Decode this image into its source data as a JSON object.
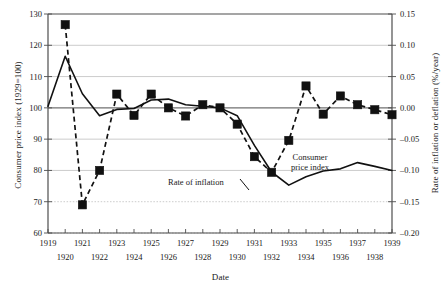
{
  "figure": {
    "background": "#ffffff",
    "plot_border_color": "#4d4d4d",
    "gridline_color": "#b5b5b5",
    "series_color": "#111111"
  },
  "axes": {
    "x": {
      "label": "Date",
      "ticks_top_row": [
        "1919",
        "1921",
        "1923",
        "1925",
        "1927",
        "1929",
        "1931",
        "1933",
        "1935",
        "1937",
        "1939"
      ],
      "ticks_bottom_row": [
        "1920",
        "1922",
        "1924",
        "1926",
        "1928",
        "1930",
        "1932",
        "1934",
        "1936",
        "1938"
      ],
      "min": 1919,
      "max": 1939
    },
    "y_left": {
      "label": "Consumer price index (1929=100)",
      "ticks": [
        "130",
        "120",
        "110",
        "100",
        "90",
        "80",
        "70",
        "60"
      ],
      "min": 60,
      "max": 130
    },
    "y_right": {
      "label": "Rate of inflation or deflation (%/year)",
      "ticks": [
        "0.15",
        "0.10",
        "0.05",
        "0.00",
        "–0.05",
        "–0.10",
        "–0.15",
        "–0.20"
      ],
      "min": -0.2,
      "max": 0.15
    }
  },
  "annotations": {
    "inflation": "Rate of inflation",
    "cpi_line1": "Consumer",
    "cpi_line2": "price index"
  },
  "chart_data": {
    "type": "line",
    "title": "",
    "xlabel": "Date",
    "ylabel": "Consumer price index (1929=100)",
    "ylabel_secondary": "Rate of inflation or deflation (%/year)",
    "xlim": [
      1919,
      1939
    ],
    "ylim": [
      60,
      130
    ],
    "ylim_secondary": [
      -0.2,
      0.15
    ],
    "grid": true,
    "legend": "inline-annotations",
    "x": [
      1919,
      1920,
      1921,
      1922,
      1923,
      1924,
      1925,
      1926,
      1927,
      1928,
      1929,
      1930,
      1931,
      1932,
      1933,
      1934,
      1935,
      1936,
      1937,
      1938,
      1939
    ],
    "series": [
      {
        "name": "Consumer price index",
        "axis": "left",
        "style": "solid",
        "marker": "none",
        "values": [
          100.5,
          116.5,
          104.5,
          97.5,
          99.5,
          99.8,
          102.5,
          102.8,
          101.0,
          100.5,
          100.0,
          97.5,
          88.0,
          79.5,
          75.3,
          78.0,
          79.8,
          80.5,
          82.5,
          81.3,
          80.0
        ]
      },
      {
        "name": "Rate of inflation",
        "axis": "right",
        "style": "dashed",
        "marker": "filled-square",
        "x": [
          1920,
          1921,
          1922,
          1923,
          1924,
          1925,
          1926,
          1927,
          1928,
          1929,
          1930,
          1931,
          1932,
          1933,
          1934,
          1935,
          1936,
          1937,
          1938,
          1939
        ],
        "values": [
          0.133,
          -0.155,
          -0.1,
          0.022,
          -0.012,
          0.022,
          0.0,
          -0.013,
          0.005,
          0.0,
          -0.026,
          -0.078,
          -0.103,
          -0.052,
          0.035,
          -0.01,
          0.019,
          0.005,
          -0.003,
          -0.011
        ]
      }
    ]
  }
}
